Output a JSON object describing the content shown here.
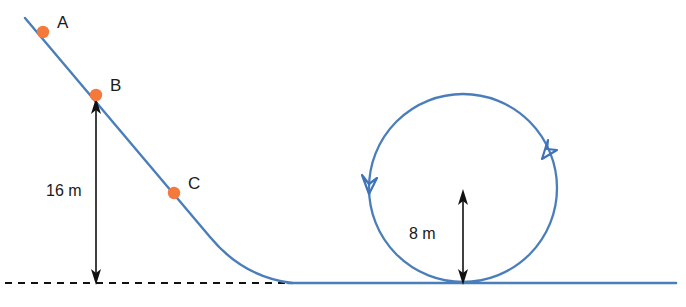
{
  "diagram": {
    "colors": {
      "track": "#4a7ebb",
      "point": "#f4793b",
      "dimension": "#111111",
      "background": "#ffffff"
    },
    "points": [
      {
        "id": "A",
        "label": "A",
        "dot_x": 43,
        "dot_y": 32,
        "label_x": 57,
        "label_y": 28
      },
      {
        "id": "B",
        "label": "B",
        "dot_x": 96,
        "dot_y": 95,
        "label_x": 110,
        "label_y": 91
      },
      {
        "id": "C",
        "label": "C",
        "dot_x": 174,
        "dot_y": 193,
        "label_x": 188,
        "label_y": 189
      }
    ],
    "dimensions": [
      {
        "id": "incline-height",
        "label": "16 m",
        "label_x": 46,
        "label_y": 196,
        "line_x": 96,
        "top_y": 100,
        "bottom_y": 283
      },
      {
        "id": "loop-radius",
        "label": "8 m",
        "label_x": 409,
        "label_y": 239,
        "line_x": 463,
        "top_y": 190,
        "bottom_y": 283
      }
    ],
    "ground": {
      "dashed_start_x": 5,
      "dashed_end_x": 292,
      "baseline_y": 283,
      "track_start_x": 288,
      "track_end_x": 676
    },
    "loop": {
      "center_x": 463,
      "center_y": 188,
      "radius": 94,
      "direction": "counterclockwise",
      "arrow_left_label": "downward-flow-arrow",
      "arrow_right_label": "upward-flow-arrow"
    },
    "incline": {
      "start_x": 25,
      "start_y": 18,
      "straight_end_x": 213,
      "straight_end_y": 240,
      "curve_end_x": 292,
      "curve_end_y": 283
    }
  }
}
